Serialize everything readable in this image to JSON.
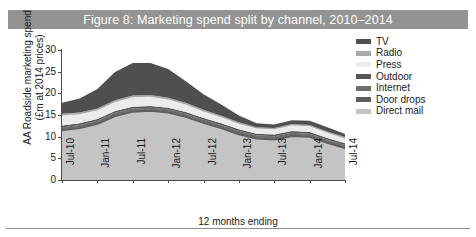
{
  "figure": {
    "title": "Figure 8: Marketing spend split by channel, 2010–2014",
    "title_bar_color": "#939393",
    "background": "#ffffff"
  },
  "axes": {
    "y_title_line1": "AA Roadside marketing spend",
    "y_title_line2": "(£m at 2014 prices)",
    "x_title": "12 months ending",
    "y_ticks": [
      "30",
      "25",
      "20",
      "15",
      "10",
      "5",
      "0"
    ],
    "x_ticks": [
      "Jul-10",
      "Jan-11",
      "Jul-11",
      "Jan-12",
      "Jul-12",
      "Jan-13",
      "Jul-13",
      "Jan-14",
      "Jul-14"
    ]
  },
  "legend": {
    "position": "right",
    "items": [
      {
        "label": "TV",
        "color": "#4f4f4f"
      },
      {
        "label": "Radio",
        "color": "#a8a8a8"
      },
      {
        "label": "Press",
        "color": "#ececec"
      },
      {
        "label": "Outdoor",
        "color": "#565656"
      },
      {
        "label": "Internet",
        "color": "#6e6e6e"
      },
      {
        "label": "Door drops",
        "color": "#5e5e5e"
      },
      {
        "label": "Direct mail",
        "color": "#c4c4c4"
      }
    ]
  },
  "chart_data": {
    "type": "area",
    "stacked": true,
    "title": "Figure 8: Marketing spend split by channel, 2010–2014",
    "xlabel": "12 months ending",
    "ylabel": "AA Roadside marketing spend (£m at 2014 prices)",
    "ylim": [
      0,
      30
    ],
    "ytick_step": 5,
    "grid": false,
    "legend_position": "right",
    "x": [
      "Jul-10",
      "Oct-10",
      "Jan-11",
      "Apr-11",
      "Jul-11",
      "Oct-11",
      "Jan-12",
      "Apr-12",
      "Jul-12",
      "Oct-12",
      "Jan-13",
      "Apr-13",
      "Jul-13",
      "Oct-13",
      "Jan-14",
      "Apr-14",
      "Jul-14"
    ],
    "x_ticks_shown": [
      "Jul-10",
      "Jan-11",
      "Jul-11",
      "Jan-12",
      "Jul-12",
      "Jan-13",
      "Jul-13",
      "Jan-14",
      "Jul-14"
    ],
    "series": [
      {
        "name": "TV",
        "color": "#4f4f4f",
        "values": [
          2.5,
          3.2,
          4.5,
          6.5,
          7.5,
          7.4,
          6.6,
          5.0,
          3.6,
          2.6,
          1.6,
          0.9,
          0.8,
          0.9,
          1.0,
          1.0,
          0.7
        ]
      },
      {
        "name": "Radio",
        "color": "#a8a8a8",
        "values": [
          0.4,
          0.4,
          0.4,
          0.4,
          0.4,
          0.4,
          0.4,
          0.4,
          0.4,
          0.3,
          0.3,
          0.3,
          0.3,
          0.3,
          0.3,
          0.3,
          0.3
        ]
      },
      {
        "name": "Press",
        "color": "#ececec",
        "values": [
          2.3,
          2.1,
          2.0,
          2.1,
          2.2,
          2.1,
          1.9,
          1.7,
          1.5,
          1.4,
          1.3,
          1.2,
          1.2,
          1.3,
          1.3,
          1.2,
          1.1
        ]
      },
      {
        "name": "Outdoor",
        "color": "#565656",
        "values": [
          0.4,
          0.4,
          0.4,
          0.4,
          0.4,
          0.4,
          0.4,
          0.4,
          0.4,
          0.4,
          0.4,
          0.4,
          0.4,
          0.4,
          0.4,
          0.4,
          0.4
        ]
      },
      {
        "name": "Internet",
        "color": "#6e6e6e",
        "values": [
          0.5,
          0.5,
          0.5,
          0.5,
          0.5,
          0.5,
          0.5,
          0.5,
          0.5,
          0.5,
          0.5,
          0.5,
          0.5,
          0.5,
          0.5,
          0.5,
          0.5
        ]
      },
      {
        "name": "Door drops",
        "color": "#5e5e5e",
        "values": [
          0.2,
          0.2,
          0.2,
          0.2,
          0.2,
          0.2,
          0.2,
          0.2,
          0.2,
          0.2,
          0.2,
          0.2,
          0.2,
          0.2,
          0.2,
          0.2,
          0.2
        ]
      },
      {
        "name": "Direct mail",
        "color": "#c4c4c4",
        "values": [
          11.5,
          12.0,
          13.0,
          14.8,
          15.8,
          16.0,
          15.6,
          14.6,
          13.2,
          12.0,
          10.6,
          9.6,
          9.4,
          10.2,
          10.0,
          8.6,
          7.4
        ]
      }
    ],
    "totals": [
      17.8,
      18.8,
      21.0,
      24.9,
      27.0,
      27.0,
      25.6,
      22.8,
      19.8,
      17.4,
      14.9,
      13.1,
      12.8,
      13.8,
      13.7,
      12.2,
      10.6
    ]
  }
}
